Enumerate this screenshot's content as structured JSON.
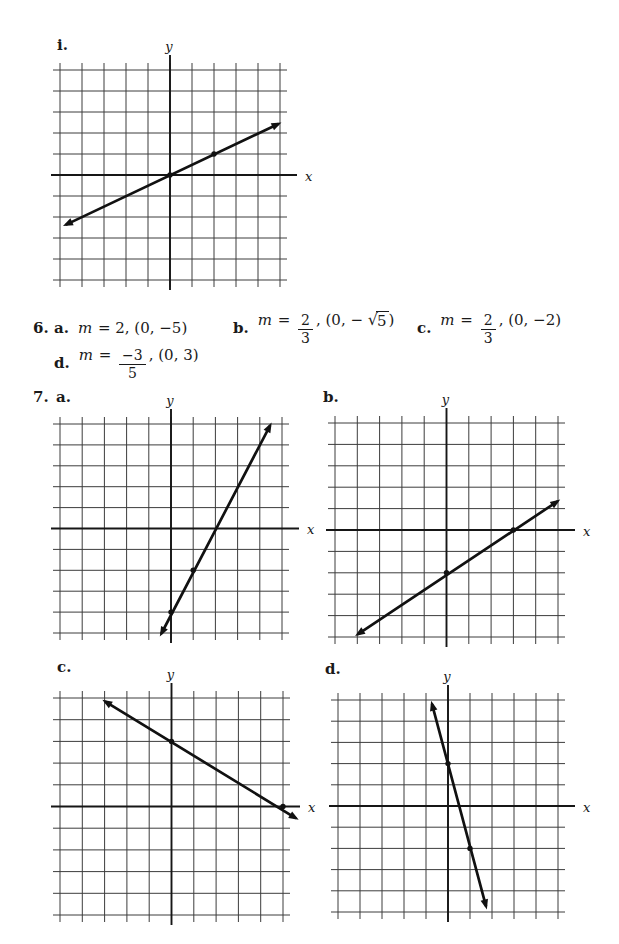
{
  "figure_i": {
    "label": "i."
  },
  "problem6": {
    "number": "6.",
    "parts": [
      {
        "label": "a.",
        "pieces": [
          {
            "v": "m"
          },
          {
            "t": " = 2, (0, −5)"
          }
        ]
      },
      {
        "label": "b.",
        "pieces": [
          {
            "v": "m"
          },
          {
            "t": " = "
          },
          {
            "frac": {
              "num": "2",
              "den": "3"
            }
          },
          {
            "t": ", (0, − "
          },
          {
            "sqrt": "5"
          },
          {
            "t": ")"
          }
        ]
      },
      {
        "label": "c.",
        "pieces": [
          {
            "v": "m"
          },
          {
            "t": " = "
          },
          {
            "frac": {
              "num": "2",
              "den": "3"
            }
          },
          {
            "t": ", (0, −2)"
          }
        ]
      },
      {
        "label": "d.",
        "pieces": [
          {
            "v": "m"
          },
          {
            "t": " = "
          },
          {
            "frac": {
              "num": "−3",
              "den": "5"
            }
          },
          {
            "t": ", (0, 3)"
          }
        ]
      }
    ]
  },
  "problem7": {
    "number": "7.",
    "part_labels": [
      "a.",
      "b.",
      "c.",
      "d."
    ]
  },
  "chart_data": [
    {
      "id": "i",
      "type": "line",
      "x_label": "x",
      "y_label": "y",
      "xlim": [
        -5,
        5
      ],
      "ylim": [
        -5,
        5
      ],
      "grid": true,
      "slope": 0.5,
      "slope_label": "1/2",
      "y_intercept": 0,
      "marked_points": [
        [
          0,
          0
        ],
        [
          2,
          1
        ]
      ],
      "line_ends": [
        [
          -4.7,
          -2.35
        ],
        [
          4.9,
          2.42
        ]
      ]
    },
    {
      "id": "7a",
      "type": "line",
      "x_label": "x",
      "y_label": "y",
      "xlim": [
        -5,
        5
      ],
      "ylim": [
        -5,
        5
      ],
      "grid": true,
      "slope": 2,
      "slope_label": "2",
      "y_intercept": -4,
      "marked_points": [
        [
          0,
          -4
        ],
        [
          1,
          -2
        ]
      ],
      "line_ends": [
        [
          -0.42,
          -5.0
        ],
        [
          4.45,
          4.9
        ]
      ]
    },
    {
      "id": "7b",
      "type": "line",
      "x_label": "x",
      "y_label": "y",
      "xlim": [
        -5,
        5
      ],
      "ylim": [
        -5,
        5
      ],
      "grid": true,
      "slope": 0.667,
      "slope_label": "2/3",
      "y_intercept": -2,
      "marked_points": [
        [
          0,
          -2
        ],
        [
          3,
          0
        ]
      ],
      "line_ends": [
        [
          -3.95,
          -4.85
        ],
        [
          4.95,
          1.32
        ]
      ]
    },
    {
      "id": "7c",
      "type": "line",
      "x_label": "x",
      "y_label": "y",
      "xlim": [
        -5,
        5
      ],
      "ylim": [
        -5,
        5
      ],
      "grid": true,
      "slope": -0.6,
      "slope_label": "-3/5",
      "y_intercept": 3,
      "marked_points": [
        [
          0,
          3
        ],
        [
          5,
          0
        ]
      ],
      "line_ends": [
        [
          -2.95,
          4.82
        ],
        [
          5.55,
          -0.52
        ]
      ]
    },
    {
      "id": "7d",
      "type": "line",
      "x_label": "x",
      "y_label": "y",
      "xlim": [
        -5,
        5
      ],
      "ylim": [
        -5,
        5
      ],
      "grid": true,
      "slope": -4,
      "slope_label": "-4",
      "y_intercept": 2,
      "marked_points": [
        [
          0,
          2
        ],
        [
          1,
          -2
        ]
      ],
      "line_ends": [
        [
          -0.72,
          4.78
        ],
        [
          1.72,
          -4.7
        ]
      ]
    }
  ],
  "style": {
    "ink": "#161616",
    "grid_line": "#3c3c3c",
    "plot_line": "#111111"
  }
}
